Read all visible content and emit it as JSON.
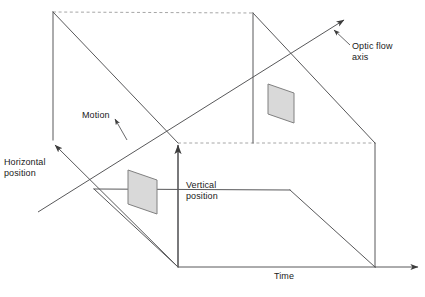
{
  "figure": {
    "type": "diagram",
    "background_color": "#ffffff"
  },
  "labels": {
    "optic_flow_axis": "Optic flow\naxis",
    "horizontal_position": "Horizontal\nposition",
    "vertical_position": "Vertical\nposition",
    "motion": "Motion",
    "time": "Time"
  },
  "colors": {
    "line": "#58585a",
    "dashed_line": "#a6a6a6",
    "patch_fill": "#d9d9d9",
    "patch_stroke": "#808080",
    "text": "#1a1a1a",
    "arrow": "#3c3c3c"
  },
  "geometry": {
    "cube": {
      "back_top_left": [
        53,
        12
      ],
      "back_top_right": [
        253,
        13
      ],
      "front_top_left": [
        178,
        143
      ],
      "front_top_right": [
        375,
        143
      ],
      "back_bottom_left": [
        53,
        143
      ],
      "back_bottom_right": [
        253,
        143
      ],
      "front_bottom_left": [
        178,
        267
      ],
      "front_bottom_right": [
        375,
        267
      ]
    },
    "axes": {
      "horizontal_position_arrow_tip": [
        53,
        143
      ],
      "vertical_position_arrow_tip": [
        178,
        143
      ],
      "time_arrow_tip": [
        420,
        267
      ],
      "optic_flow_arrow_tip": [
        346,
        18
      ],
      "optic_flow_tail": [
        38,
        212
      ]
    },
    "patches": [
      {
        "name": "front-stimulus-patch",
        "points": "128,170 157,180 157,214 128,204"
      },
      {
        "name": "rear-stimulus-patch",
        "points": "268,84 294,93 294,123 268,114"
      }
    ]
  }
}
